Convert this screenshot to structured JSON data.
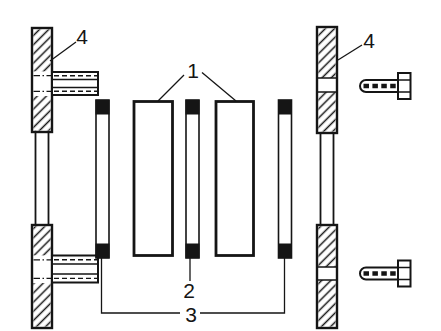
{
  "canvas": {
    "background": "#ffffff",
    "line_color": "#151515"
  },
  "callouts": {
    "label_1": "1",
    "label_2": "2",
    "label_3": "3",
    "label_4_left": "4",
    "label_4_right": "4"
  }
}
